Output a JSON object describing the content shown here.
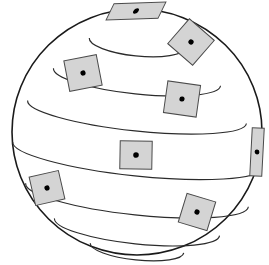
{
  "figure": {
    "type": "geometric-diagram",
    "canvas": {
      "width": 269,
      "height": 265,
      "background": "#ffffff"
    },
    "sphere": {
      "center_x": 137,
      "center_y": 132,
      "radius_x": 125,
      "radius_y": 123,
      "outline_color": "#1a1a1a",
      "outline_width": 1.6,
      "fill_color": "#ffffff"
    },
    "latitudes": {
      "line_color": "#2b2b2b",
      "line_width": 1.15,
      "tilt_degrees": 6,
      "count": 7,
      "bands": [
        {
          "name": "latitude-1",
          "center_y": 43,
          "half_width": 48,
          "half_height": 13,
          "sweep": "down"
        },
        {
          "name": "latitude-2",
          "center_y": 77,
          "half_width": 84,
          "half_height": 17,
          "sweep": "down"
        },
        {
          "name": "latitude-3",
          "center_y": 112,
          "half_width": 110,
          "half_height": 19,
          "sweep": "down"
        },
        {
          "name": "latitude-4",
          "center_y": 155,
          "half_width": 125,
          "half_height": 21,
          "sweep": "down"
        },
        {
          "name": "latitude-5",
          "center_y": 195,
          "half_width": 112,
          "half_height": 20,
          "sweep": "down"
        },
        {
          "name": "latitude-6",
          "center_y": 227,
          "half_width": 83,
          "half_height": 17,
          "sweep": "down"
        },
        {
          "name": "latitude-7",
          "center_y": 248,
          "half_width": 47,
          "half_height": 12,
          "sweep": "down"
        }
      ]
    },
    "patches": {
      "fill_color": "#d4d4d4",
      "stroke_color": "#4a4a4a",
      "dot_color": "#000000",
      "count": 9,
      "items": [
        {
          "id": "patch-top",
          "cx": 136,
          "cy": 11,
          "w": 52,
          "h": 16,
          "rotation": -2,
          "skew": -28,
          "dot_r": 2.6
        },
        {
          "id": "patch-upper-right",
          "cx": 191,
          "cy": 42,
          "w": 33,
          "h": 33,
          "rotation": 41,
          "skew": 0,
          "dot_r": 2.6
        },
        {
          "id": "patch-upper-left",
          "cx": 83,
          "cy": 73,
          "w": 33,
          "h": 31,
          "rotation": -11,
          "skew": 0,
          "dot_r": 2.6
        },
        {
          "id": "patch-mid-right",
          "cx": 182,
          "cy": 99,
          "w": 33,
          "h": 32,
          "rotation": 8,
          "skew": 0,
          "dot_r": 2.6
        },
        {
          "id": "patch-center",
          "cx": 136,
          "cy": 155,
          "w": 32,
          "h": 28,
          "rotation": 1,
          "skew": 0,
          "dot_r": 2.8
        },
        {
          "id": "patch-limb-right",
          "cx": 257,
          "cy": 152,
          "w": 12,
          "h": 48,
          "rotation": 3,
          "skew": 0,
          "dot_r": 2.4
        },
        {
          "id": "patch-lower-left",
          "cx": 47,
          "cy": 188,
          "w": 30,
          "h": 29,
          "rotation": -13,
          "skew": 0,
          "dot_r": 2.6
        },
        {
          "id": "patch-lower-right",
          "cx": 197,
          "cy": 212,
          "w": 30,
          "h": 30,
          "rotation": 17,
          "skew": 0,
          "dot_r": 2.6
        },
        {
          "id": "patch-far-right",
          "cx": 255,
          "cy": 152,
          "w": 0,
          "h": 0,
          "rotation": 0,
          "skew": 0,
          "dot_r": 0
        }
      ]
    }
  }
}
